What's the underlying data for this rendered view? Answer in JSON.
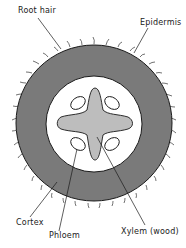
{
  "diagram": {
    "labels": {
      "root_hair": "Root hair",
      "epidermis": "Epidermis",
      "cortex": "Cortex",
      "phloem": "Phloem",
      "xylem": "Xylem (wood)"
    },
    "colors": {
      "cortex": "#7a7a7a",
      "stele": "#ffffff",
      "xylem": "#bdbdbd",
      "outline": "#1a1a1a",
      "background": "#ffffff"
    }
  }
}
